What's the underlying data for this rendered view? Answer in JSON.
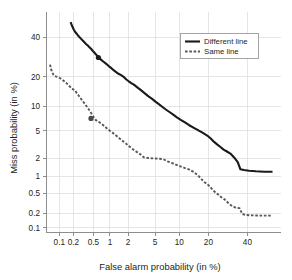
{
  "chart_data": {
    "type": "line",
    "title": "",
    "xlabel": "False alarm probability (in %)",
    "ylabel": "Miss probability (in %)",
    "scale": "normal-deviate (DET)",
    "grid": true,
    "legend_position": "top-right",
    "xlim": [
      0.05,
      60
    ],
    "ylim": [
      0.08,
      55
    ],
    "xticks": [
      0.1,
      0.2,
      0.5,
      1,
      2,
      5,
      10,
      20,
      40
    ],
    "xtick_labels": [
      "0.1",
      "0.2",
      "0.5",
      "1",
      "2",
      "5",
      "10",
      "20",
      "40"
    ],
    "yticks": [
      0.1,
      0.2,
      0.5,
      1,
      2,
      5,
      10,
      20,
      40
    ],
    "ytick_labels": [
      "0.1",
      "0.2",
      "0.5",
      "1",
      "2",
      "5",
      "10",
      "20",
      "40"
    ],
    "series": [
      {
        "name": "Different line",
        "style": "solid",
        "color": "#1a1a1a",
        "marker_point": {
          "x": 0.62,
          "y": 29.0
        },
        "x": [
          0.175,
          0.19,
          0.205,
          0.22,
          0.24,
          0.26,
          0.285,
          0.31,
          0.335,
          0.36,
          0.39,
          0.42,
          0.45,
          0.48,
          0.52,
          0.56,
          0.6,
          0.64,
          0.7,
          0.76,
          0.83,
          0.9,
          0.98,
          1.07,
          1.17,
          1.28,
          1.4,
          1.55,
          1.7,
          1.88,
          2.05,
          2.25,
          2.5,
          2.75,
          3.05,
          3.35,
          3.7,
          4.1,
          4.55,
          5.05,
          5.6,
          6.2,
          6.9,
          7.65,
          8.5,
          9.4,
          10.4,
          11.6,
          12.9,
          14.3,
          15.9,
          17.6,
          19.5,
          21.0,
          22.5,
          24.0,
          25.5,
          27.0,
          28.5,
          30.5,
          32.5,
          34.5,
          36.0,
          38.0,
          41.0,
          45.0,
          50.0,
          55.0
        ],
        "y": [
          49.0,
          46.5,
          44.5,
          43.0,
          41.8,
          40.5,
          39.3,
          38.2,
          37.2,
          36.3,
          35.4,
          34.5,
          33.6,
          32.7,
          31.6,
          30.6,
          29.6,
          28.7,
          27.8,
          27.0,
          26.2,
          25.4,
          24.5,
          23.7,
          22.8,
          22.0,
          21.3,
          20.7,
          20.0,
          18.9,
          18.2,
          17.5,
          16.8,
          16.0,
          15.2,
          14.4,
          13.6,
          12.8,
          12.1,
          11.3,
          10.6,
          9.9,
          9.2,
          8.6,
          8.0,
          7.4,
          6.9,
          6.4,
          5.9,
          5.5,
          5.1,
          4.7,
          4.3,
          3.9,
          3.5,
          3.2,
          2.95,
          2.7,
          2.55,
          2.35,
          2.05,
          1.72,
          1.32,
          1.28,
          1.25,
          1.22,
          1.2,
          1.2
        ]
      },
      {
        "name": "Same line",
        "style": "dashed",
        "color": "#585858",
        "marker_point": {
          "x": 0.45,
          "y": 7.2
        },
        "x": [
          0.062,
          0.065,
          0.07,
          0.076,
          0.083,
          0.09,
          0.098,
          0.107,
          0.117,
          0.128,
          0.14,
          0.153,
          0.167,
          0.182,
          0.198,
          0.215,
          0.235,
          0.255,
          0.278,
          0.3,
          0.328,
          0.357,
          0.39,
          0.425,
          0.462,
          0.505,
          0.55,
          0.6,
          0.655,
          0.715,
          0.78,
          0.85,
          0.93,
          1.01,
          1.11,
          1.21,
          1.32,
          1.44,
          1.58,
          1.72,
          1.88,
          2.05,
          2.25,
          2.45,
          2.68,
          2.93,
          3.2,
          3.5,
          3.82,
          4.2,
          4.6,
          5.1,
          5.7,
          6.4,
          7.2,
          8.1,
          9.1,
          10.3,
          11.6,
          13.0,
          14.5,
          15.8,
          17.0,
          18.2,
          19.4,
          20.6,
          21.8,
          23.0,
          24.4,
          25.8,
          27.5,
          29.5,
          31.5,
          33.5,
          35.5,
          37.0,
          39.0,
          43.0,
          48.0,
          55.0
        ],
        "y": [
          25.5,
          23.5,
          21.8,
          20.5,
          20.2,
          20.0,
          19.7,
          19.3,
          18.8,
          18.2,
          17.6,
          17.0,
          16.3,
          15.6,
          15.2,
          14.9,
          13.9,
          13.2,
          12.4,
          11.7,
          11.0,
          10.3,
          9.6,
          8.9,
          8.2,
          7.5,
          6.9,
          6.6,
          6.4,
          6.1,
          5.8,
          5.5,
          5.2,
          4.95,
          4.7,
          4.45,
          4.2,
          3.95,
          3.72,
          3.5,
          3.28,
          3.05,
          2.85,
          2.68,
          2.52,
          2.38,
          2.22,
          2.05,
          2.02,
          2.0,
          1.98,
          1.97,
          1.95,
          1.93,
          1.78,
          1.68,
          1.58,
          1.48,
          1.38,
          1.3,
          1.18,
          1.05,
          0.92,
          0.8,
          0.74,
          0.66,
          0.58,
          0.52,
          0.47,
          0.42,
          0.38,
          0.32,
          0.28,
          0.26,
          0.255,
          0.195,
          0.185,
          0.182,
          0.18,
          0.18
        ]
      }
    ]
  },
  "legend": {
    "entries": [
      {
        "label": "Different line",
        "style": "solid"
      },
      {
        "label": "Same line",
        "style": "dashed"
      }
    ]
  }
}
